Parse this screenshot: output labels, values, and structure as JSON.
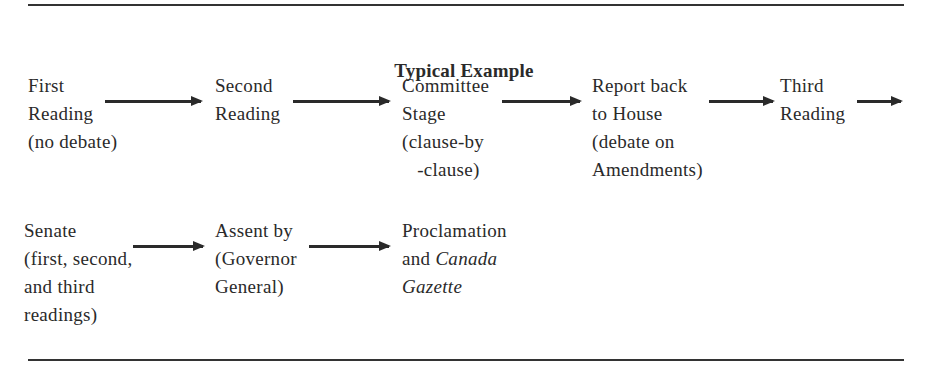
{
  "title": "Typical Example",
  "row1": [
    {
      "lines": [
        "First",
        "Reading",
        "(no debate)"
      ]
    },
    {
      "lines": [
        "Second",
        "Reading"
      ]
    },
    {
      "lines": [
        "Committee",
        "Stage",
        "(clause-by",
        "   -clause)"
      ]
    },
    {
      "lines": [
        "Report back",
        "to House",
        "(debate on",
        "Amendments)"
      ]
    },
    {
      "lines": [
        "Third",
        "Reading"
      ]
    }
  ],
  "row2": [
    {
      "lines": [
        "Senate",
        "(first, second,",
        "and third",
        "readings)"
      ]
    },
    {
      "lines": [
        "Assent by",
        "(Governor",
        "General)"
      ]
    },
    {
      "lines": [
        "Proclamation"
      ],
      "line2_prefix": "and ",
      "line2_italic": "Canada",
      "line3_italic": "Gazette"
    }
  ],
  "colors": {
    "text": "#2a2a2a",
    "rule": "#333333",
    "background": "#ffffff"
  }
}
